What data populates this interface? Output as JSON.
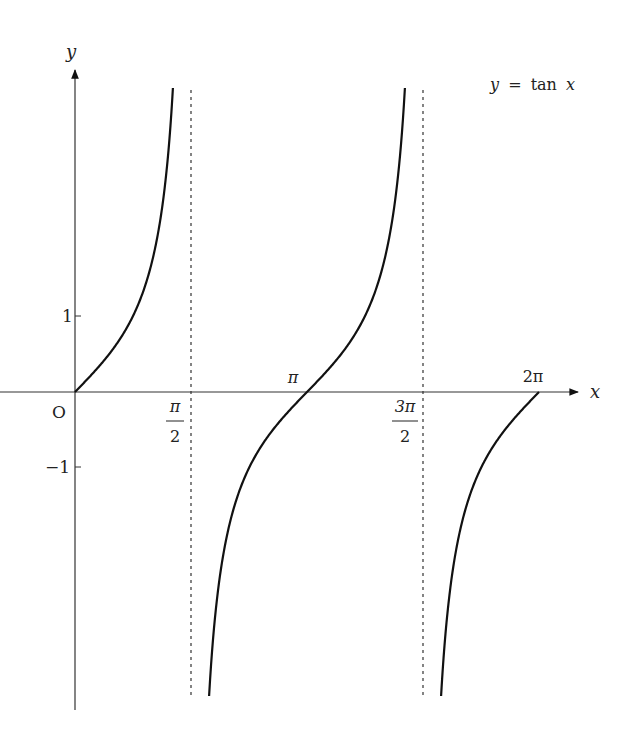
{
  "chart_data": {
    "type": "line",
    "title": "y = tan x",
    "xlabel": "x",
    "ylabel": "y",
    "origin_label": "O",
    "xlim": [
      0,
      6.2832
    ],
    "ylim": [
      -4,
      4
    ],
    "grid": false,
    "x_ticks": [
      {
        "value": 1.5708,
        "label": "π/2",
        "num": "π",
        "den": "2"
      },
      {
        "value": 3.1416,
        "label": "π"
      },
      {
        "value": 4.7124,
        "label": "3π/2",
        "num": "3π",
        "den": "2"
      },
      {
        "value": 6.2832,
        "label": "2π"
      }
    ],
    "y_ticks": [
      {
        "value": 1,
        "label": "1"
      },
      {
        "value": -1,
        "label": "−1"
      }
    ],
    "asymptotes": [
      1.5708,
      4.7124
    ],
    "series": [
      {
        "name": "tan x branch 1",
        "x_range": [
          0,
          1.3258
        ],
        "y_range": [
          0,
          4
        ]
      },
      {
        "name": "tan x branch 2",
        "x_range": [
          1.8158,
          4.4674
        ],
        "y_range": [
          -4,
          4
        ]
      },
      {
        "name": "tan x branch 3",
        "x_range": [
          4.9574,
          6.2832
        ],
        "y_range": [
          -4,
          0
        ]
      }
    ],
    "annotation": "y = tan x"
  },
  "legend": {
    "label_y": "y",
    "label_eq": "=",
    "label_fn": "tan",
    "label_x": "x"
  }
}
